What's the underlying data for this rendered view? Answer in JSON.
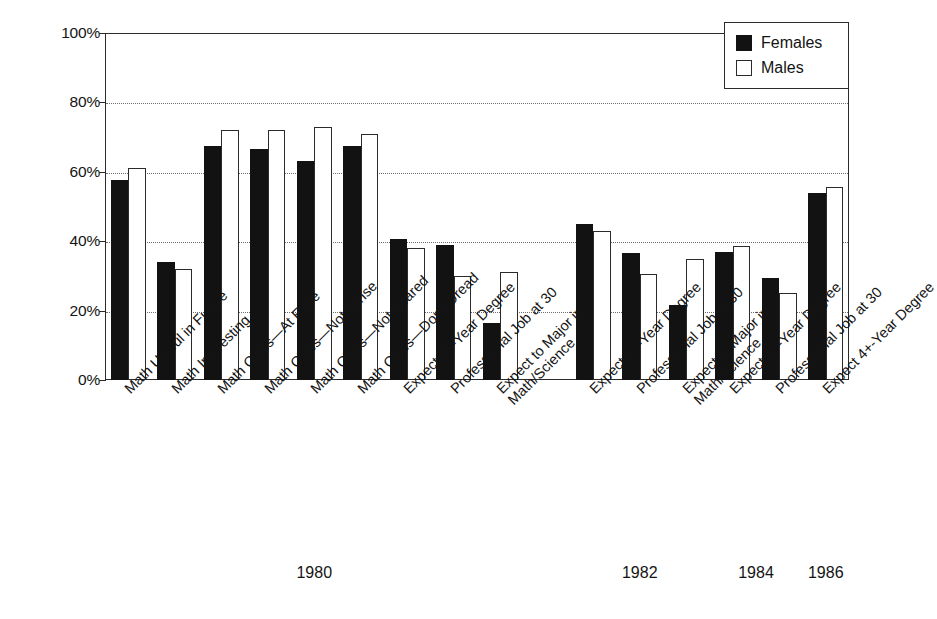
{
  "chart_data": {
    "type": "bar",
    "title": "",
    "subtitle": "",
    "xlabel": "",
    "ylabel": "",
    "ylim": [
      0,
      100
    ],
    "y_ticks": [
      "0%",
      "20%",
      "40%",
      "60%",
      "80%",
      "100%"
    ],
    "y_tick_values": [
      0,
      20,
      40,
      60,
      80,
      100
    ],
    "grid": "horizontal-dotted",
    "legend_position": "top-right",
    "legend": [
      "Females",
      "Males"
    ],
    "series": [
      {
        "name": "Females",
        "color": "#121212",
        "values": [
          57.5,
          34.0,
          67.5,
          66.5,
          63.0,
          67.5,
          40.5,
          39.0,
          16.5,
          null,
          45.0,
          36.5,
          21.5,
          37.0,
          29.5,
          54.0
        ]
      },
      {
        "name": "Males",
        "color": "#ffffff",
        "values": [
          61.0,
          32.0,
          72.0,
          72.0,
          73.0,
          71.0,
          38.0,
          30.0,
          31.0,
          null,
          43.0,
          30.5,
          35.0,
          38.5,
          25.0,
          55.5
        ]
      }
    ],
    "categories": [
      "Math Useful in Future",
      "Math Interesting",
      "Math Class—At Ease",
      "Math Class—Not Tense",
      "Math Class—Not Scared",
      "Math Class—Don't Dread",
      "Expect 4+-Year Degree",
      "Professional Job at 30",
      "Expect to Major in Math/Science",
      "",
      "Expect 4+-Year Degree",
      "Professional Job at 30",
      "Expect to Major in Math/Science",
      "Expect 4+-Year Degree",
      "Professional Job at 30",
      "Expect 4+-Year Degree"
    ],
    "category_lines": [
      [
        "Math Useful in Future"
      ],
      [
        "Math Interesting"
      ],
      [
        "Math Class—At Ease"
      ],
      [
        "Math Class—Not Tense"
      ],
      [
        "Math Class—Not Scared"
      ],
      [
        "Math Class—Don't Dread"
      ],
      [
        "Expect 4+-Year Degree"
      ],
      [
        "Professional Job at 30"
      ],
      [
        "Expect to Major in",
        "Math/Science"
      ],
      [
        ""
      ],
      [
        "Expect 4+-Year Degree"
      ],
      [
        "Professional Job at 30"
      ],
      [
        "Expect to Major in",
        "Math/Science"
      ],
      [
        "Expect 4+-Year Degree"
      ],
      [
        "Professional Job at 30"
      ],
      [
        "Expect 4+-Year Degree"
      ]
    ],
    "group_labels": [
      "1980",
      "1982",
      "1984",
      "1986"
    ],
    "group_spans": [
      {
        "label": "1980",
        "first": 0,
        "last": 8
      },
      {
        "label": "1982",
        "first": 10,
        "last": 12
      },
      {
        "label": "1984",
        "first": 13,
        "last": 14
      },
      {
        "label": "1986",
        "first": 15,
        "last": 15
      }
    ]
  },
  "legend": {
    "items": [
      {
        "label": "Females",
        "swatch": "filled-black-square"
      },
      {
        "label": "Males",
        "swatch": "outlined-white-square"
      }
    ]
  },
  "axis": {
    "y_labels": [
      "100%",
      "80%",
      "60%",
      "40%",
      "20%",
      "0%"
    ]
  },
  "years": {
    "items": [
      "1980",
      "1982",
      "1984",
      "1986"
    ]
  },
  "colors": {
    "female_fill": "#121212",
    "male_fill": "#ffffff",
    "stroke": "#2b2b2b",
    "grid": "#6e6e6e",
    "background": "#ffffff"
  }
}
